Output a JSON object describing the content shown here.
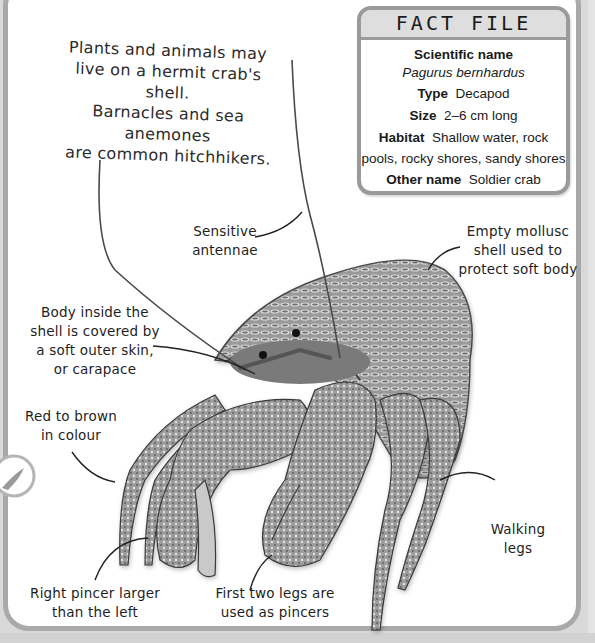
{
  "intro_text": {
    "lines": [
      "Plants and animals may",
      "live on a hermit crab's shell.",
      "Barnacles and sea anemones",
      "are common hitchhikers."
    ]
  },
  "fact_file": {
    "title": "FACT FILE",
    "scientific_name_label": "Scientific name",
    "scientific_name_value": "Pagurus bernhardus",
    "type_label": "Type",
    "type_value": "Decapod",
    "size_label": "Size",
    "size_value": "2–6 cm long",
    "habitat_label": "Habitat",
    "habitat_value_line1": "Shallow water, rock",
    "habitat_value_line2": "pools, rocky shores, sandy shores",
    "other_name_label": "Other name",
    "other_name_value": "Soldier crab"
  },
  "labels": {
    "antennae": [
      "Sensitive",
      "antennae"
    ],
    "shell": [
      "Empty mollusc",
      "shell used to",
      "protect soft body"
    ],
    "carapace": [
      "Body inside the",
      "shell is covered by",
      "a soft outer skin,",
      "or carapace"
    ],
    "colour": [
      "Red to brown",
      "in colour"
    ],
    "walking_legs": [
      "Walking",
      "legs"
    ],
    "right_pincer": [
      "Right pincer larger",
      "than the left"
    ],
    "pincers": [
      "First two legs are",
      "used as pincers"
    ]
  },
  "illustration": {
    "subject": "hermit-crab-in-shell",
    "palette": {
      "dark": "#2b2b2b",
      "mid": "#8a8a8a",
      "light": "#cfcfcf",
      "border": "#a9a9a9",
      "background": "#d9d9d9"
    }
  }
}
